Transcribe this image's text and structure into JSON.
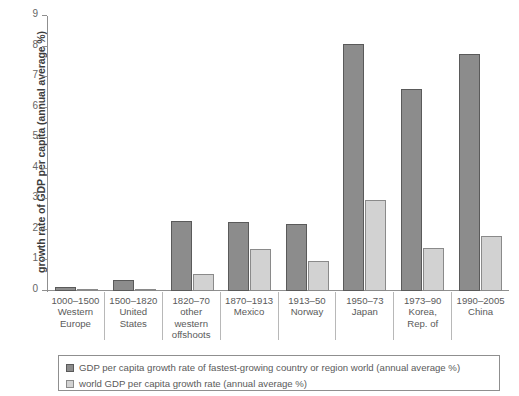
{
  "chart_data": {
    "type": "bar",
    "title": "",
    "xlabel": "",
    "ylabel": "growth rate of GDP per capita (annual average %)",
    "ylim": [
      0,
      9
    ],
    "ytick_labels": [
      "0",
      "1",
      "2",
      "3",
      "4",
      "5",
      "6",
      "7",
      "8",
      "9"
    ],
    "grid": false,
    "legend_position": "bottom",
    "categories": [
      {
        "period": "1000–1500",
        "place": "Western Europe",
        "lines": [
          "1000–1500",
          "Western",
          "Europe"
        ]
      },
      {
        "period": "1500–1820",
        "place": "United States",
        "lines": [
          "1500–1820",
          "United",
          "States"
        ]
      },
      {
        "period": "1820–70",
        "place": "other western offshoots",
        "lines": [
          "1820–70",
          "other",
          "western",
          "offshoots"
        ]
      },
      {
        "period": "1870–1913",
        "place": "Mexico",
        "lines": [
          "1870–1913",
          "Mexico"
        ]
      },
      {
        "period": "1913–50",
        "place": "Norway",
        "lines": [
          "1913–50",
          "Norway"
        ]
      },
      {
        "period": "1950–73",
        "place": "Japan",
        "lines": [
          "1950–73",
          "Japan"
        ]
      },
      {
        "period": "1973–90",
        "place": "Korea, Rep. of",
        "lines": [
          "1973–90",
          "Korea,",
          "Rep. of"
        ]
      },
      {
        "period": "1990–2005",
        "place": "China",
        "lines": [
          "1990–2005",
          "China"
        ]
      }
    ],
    "series": [
      {
        "name": "GDP per capita growth rate of fastest-growing country or region world (annual average %)",
        "color": "#8c8c8c",
        "values": [
          0.13,
          0.35,
          2.3,
          2.27,
          2.2,
          8.1,
          6.6,
          7.75
        ]
      },
      {
        "name": "world GDP per capita growth rate (annual average %)",
        "color": "#d2d2d2",
        "values": [
          0.05,
          0.06,
          0.55,
          1.37,
          0.99,
          2.98,
          1.4,
          1.8
        ]
      }
    ]
  },
  "legend": {
    "items": [
      {
        "swatch": "dark",
        "label": "GDP per capita growth rate of fastest-growing country or region world (annual average %)"
      },
      {
        "swatch": "light",
        "label": "world GDP per capita growth rate (annual average %)"
      }
    ]
  }
}
